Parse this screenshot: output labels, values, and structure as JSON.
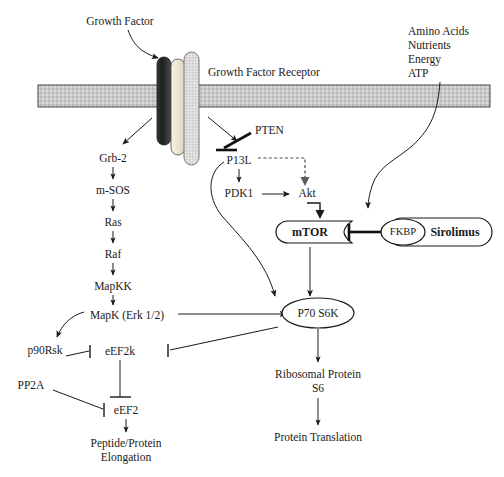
{
  "figure": {
    "type": "biological-signaling-pathway-diagram",
    "background_color": "#ffffff",
    "line_color": "#1a1a1a"
  },
  "labels": {
    "growth_factor": "Growth Factor",
    "growth_factor_receptor": "Growth Factor Receptor",
    "amino_acids": "Amino Acids",
    "nutrients": "Nutrients",
    "energy": "Energy",
    "atp": "ATP",
    "grb2": "Grb-2",
    "msos": "m-SOS",
    "ras": "Ras",
    "raf": "Raf",
    "mapkk": "MapKK",
    "mapk": "MapK (Erk 1/2)",
    "p90rsk": "p90Rsk",
    "eef2k": "eEF2k",
    "pp2a": "PP2A",
    "eef2": "eEF2",
    "peptide_protein": "Peptide/Protein",
    "elongation": "Elongation",
    "pten": "PTEN",
    "p13l": "P13L",
    "pdk1": "PDK1",
    "akt": "Akt",
    "mtor": "mTOR",
    "fkbp": "FKBP",
    "sirolimus": "Sirolimus",
    "p70s6k": "P70 S6K",
    "ribosomal_protein": "Ribosomal Protein",
    "s6": "S6",
    "protein_translation": "Protein Translation"
  },
  "membrane": {
    "name": "plasma-membrane",
    "fill_color": "#c9c9c9",
    "border_color": "#555555"
  },
  "receptor": {
    "name": "growth-factor-receptor",
    "subunits": [
      {
        "name": "receptor-subunit-dark",
        "color": "#2b2b2b"
      },
      {
        "name": "receptor-subunit-cream",
        "color": "#efe8d8"
      },
      {
        "name": "receptor-subunit-grey",
        "color": "#d5d5d5"
      }
    ]
  },
  "nodes": [
    {
      "id": "grb2",
      "label": "Grb-2",
      "shape": "text"
    },
    {
      "id": "msos",
      "label": "m-SOS",
      "shape": "text"
    },
    {
      "id": "ras",
      "label": "Ras",
      "shape": "text"
    },
    {
      "id": "raf",
      "label": "Raf",
      "shape": "text"
    },
    {
      "id": "mapkk",
      "label": "MapKK",
      "shape": "text"
    },
    {
      "id": "mapk",
      "label": "MapK (Erk 1/2)",
      "shape": "text"
    },
    {
      "id": "p90rsk",
      "label": "p90Rsk",
      "shape": "text"
    },
    {
      "id": "eef2k",
      "label": "eEF2k",
      "shape": "text"
    },
    {
      "id": "pp2a",
      "label": "PP2A",
      "shape": "text"
    },
    {
      "id": "eef2",
      "label": "eEF2",
      "shape": "text"
    },
    {
      "id": "pten",
      "label": "PTEN",
      "shape": "text"
    },
    {
      "id": "p13l",
      "label": "P13L",
      "shape": "text"
    },
    {
      "id": "pdk1",
      "label": "PDK1",
      "shape": "text"
    },
    {
      "id": "akt",
      "label": "Akt",
      "shape": "text"
    },
    {
      "id": "mtor",
      "label": "mTOR",
      "shape": "notched-capsule"
    },
    {
      "id": "fkbp",
      "label": "FKBP",
      "shape": "ellipse"
    },
    {
      "id": "sirolimus",
      "label": "Sirolimus",
      "shape": "capsule"
    },
    {
      "id": "p70s6k",
      "label": "P70 S6K",
      "shape": "ellipse"
    }
  ],
  "edges": [
    {
      "from": "growth_factor",
      "to": "receptor",
      "kind": "curved-arrow"
    },
    {
      "from": "receptor",
      "to": "grb2",
      "kind": "arrow"
    },
    {
      "from": "receptor",
      "to": "p13l",
      "kind": "arrow"
    },
    {
      "from": "grb2",
      "to": "msos",
      "kind": "arrow"
    },
    {
      "from": "msos",
      "to": "ras",
      "kind": "arrow"
    },
    {
      "from": "ras",
      "to": "raf",
      "kind": "arrow"
    },
    {
      "from": "raf",
      "to": "mapkk",
      "kind": "arrow"
    },
    {
      "from": "mapkk",
      "to": "mapk",
      "kind": "arrow"
    },
    {
      "from": "mapk",
      "to": "p90rsk",
      "kind": "curved-arrow"
    },
    {
      "from": "mapk",
      "to": "p70s6k",
      "kind": "arrow"
    },
    {
      "from": "p90rsk",
      "to": "eef2k",
      "kind": "inhibition"
    },
    {
      "from": "p70s6k",
      "to": "eef2k",
      "kind": "inhibition"
    },
    {
      "from": "eef2k",
      "to": "eef2",
      "kind": "inhibition"
    },
    {
      "from": "pp2a",
      "to": "eef2",
      "kind": "inhibition"
    },
    {
      "from": "eef2",
      "to": "peptide_protein",
      "kind": "arrow"
    },
    {
      "from": "pten",
      "to": "p13l",
      "kind": "inhibition-thick"
    },
    {
      "from": "p13l",
      "to": "pdk1",
      "kind": "arrow"
    },
    {
      "from": "p13l",
      "to": "akt",
      "kind": "dashed-arrow"
    },
    {
      "from": "p13l",
      "to": "p70s6k",
      "kind": "curved-arrow"
    },
    {
      "from": "pdk1",
      "to": "akt",
      "kind": "arrow"
    },
    {
      "from": "akt",
      "to": "mtor",
      "kind": "elbow-arrow"
    },
    {
      "from": "amino_acids",
      "to": "mtor",
      "kind": "curved-arrow"
    },
    {
      "from": "mtor",
      "to": "p70s6k",
      "kind": "arrow"
    },
    {
      "from": "fkbp",
      "to": "mtor",
      "kind": "inhibition-thick"
    },
    {
      "from": "p70s6k",
      "to": "ribosomal_protein",
      "kind": "arrow"
    },
    {
      "from": "ribosomal_protein",
      "to": "protein_translation",
      "kind": "arrow"
    }
  ]
}
